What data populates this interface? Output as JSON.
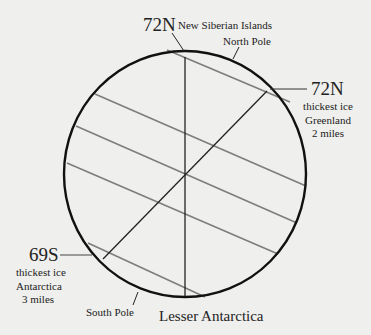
{
  "diagram": {
    "type": "earth-axis-cross-section",
    "circle": {
      "cx": 185,
      "cy": 174,
      "rx": 121,
      "ry": 123,
      "stroke": "#111111"
    },
    "axis_line": {
      "x1": 185,
      "y1": 57,
      "x2": 185,
      "y2": 298
    },
    "tilted_line": {
      "x1": 267,
      "y1": 91,
      "x2": 103,
      "y2": 259
    },
    "parallel_lines": [
      {
        "x1": 167,
        "y1": 50,
        "x2": 290,
        "y2": 102
      },
      {
        "x1": 95,
        "y1": 94,
        "x2": 306,
        "y2": 186
      },
      {
        "x1": 76,
        "y1": 126,
        "x2": 297,
        "y2": 223
      },
      {
        "x1": 67,
        "y1": 163,
        "x2": 278,
        "y2": 254
      },
      {
        "x1": 88,
        "y1": 243,
        "x2": 205,
        "y2": 297
      }
    ],
    "colors": {
      "background": "#efefed",
      "outline": "#111111",
      "parallel": "#7d7d7d",
      "text": "#222222"
    }
  },
  "labels": {
    "top_latitude": "72N",
    "top_place": "New Siberian Islands",
    "north_pole": "North Pole",
    "right_latitude": "72N",
    "right_lines": [
      "thickest ice",
      "Greenland",
      "2 miles"
    ],
    "left_latitude": "69S",
    "left_lines": [
      "thickest ice",
      "Antarctica",
      "3 miles"
    ],
    "south_pole": "South Pole",
    "bottom_place": "Lesser Antarctica"
  }
}
